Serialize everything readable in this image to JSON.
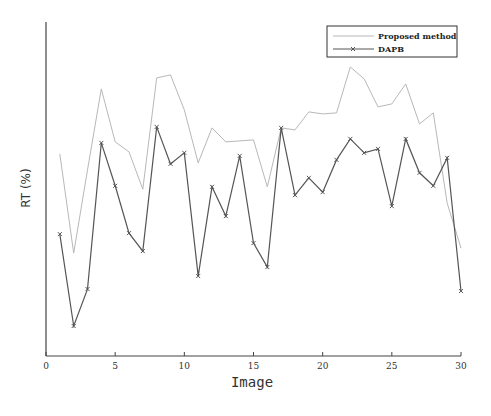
{
  "chart_data": {
    "type": "line",
    "title": "",
    "xlabel": "Image",
    "ylabel": "RT (%)",
    "xlim": [
      0,
      30
    ],
    "ylim": [
      0,
      100
    ],
    "y_ticks_shown": false,
    "x_ticks": [
      0,
      5,
      10,
      15,
      20,
      25,
      30
    ],
    "grid": false,
    "legend_position": "upper right",
    "x": [
      1,
      2,
      3,
      4,
      5,
      6,
      7,
      8,
      9,
      10,
      11,
      12,
      13,
      14,
      15,
      16,
      17,
      18,
      19,
      20,
      21,
      22,
      23,
      24,
      25,
      26,
      27,
      28,
      29,
      30
    ],
    "series": [
      {
        "name": "Proposed method",
        "color": "#b8b8b8",
        "marker": "none",
        "values": [
          60.4,
          30.6,
          55.6,
          79.9,
          64.0,
          61.0,
          49.8,
          83.2,
          84.1,
          73.6,
          57.7,
          68.2,
          64.0,
          64.3,
          64.6,
          50.5,
          68.2,
          67.6,
          73.0,
          72.4,
          72.7,
          86.5,
          82.9,
          74.5,
          75.4,
          81.4,
          69.4,
          72.7,
          45.6,
          32.1
        ]
      },
      {
        "name": "DAPB",
        "color": "#555555",
        "marker": "x",
        "values": [
          36.3,
          8.7,
          19.8,
          63.7,
          50.8,
          36.6,
          31.2,
          68.5,
          57.4,
          60.7,
          23.7,
          50.5,
          41.7,
          59.8,
          33.6,
          26.4,
          68.2,
          48.0,
          53.2,
          48.9,
          58.6,
          64.9,
          60.7,
          61.9,
          44.7,
          64.9,
          54.7,
          50.8,
          59.2,
          19.2
        ]
      }
    ]
  },
  "axes": {
    "xlabel": "Image",
    "ylabel": "RT (%)",
    "x_tick_labels": [
      "0",
      "5",
      "10",
      "15",
      "20",
      "25",
      "30"
    ]
  },
  "legend": {
    "items": [
      {
        "label": "Proposed method"
      },
      {
        "label": "DAPB"
      }
    ]
  }
}
